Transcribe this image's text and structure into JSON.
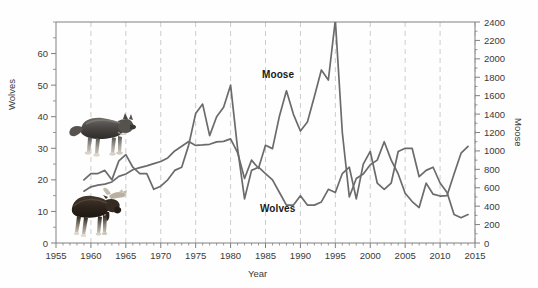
{
  "figure": {
    "background": "#ffffff",
    "line_color_moose": "#6b6b6b",
    "line_color_wolves": "#6b6b6b",
    "grid_color": "#cccccc",
    "axis_color": "#808080",
    "text_color": "#3a3a3a"
  },
  "chart_data": {
    "type": "line",
    "title": "",
    "xlabel": "Year",
    "ylabel": "Wolves",
    "ylabel_right": "Moose",
    "xlim": [
      1955,
      2015
    ],
    "ylim": [
      0,
      70
    ],
    "ylim_right": [
      0,
      2400
    ],
    "grid": true,
    "grid_axis": "x",
    "legend": "inline-annotations",
    "xticks": [
      1955,
      1960,
      1965,
      1970,
      1975,
      1980,
      1985,
      1990,
      1995,
      2000,
      2005,
      2010,
      2015
    ],
    "yticks_left": [
      0,
      10,
      20,
      30,
      40,
      50,
      60
    ],
    "yticks_right": [
      0,
      200,
      400,
      600,
      800,
      1000,
      1200,
      1400,
      1600,
      1800,
      2000,
      2200,
      2400
    ],
    "annotations": [
      {
        "text": "Moose",
        "x": 1989,
        "y": 1800
      },
      {
        "text": "Wolves",
        "x": 1988,
        "y": 340
      }
    ],
    "images": [
      {
        "name": "wolf-photo",
        "x": 1960.5,
        "y": 36
      },
      {
        "name": "moose-photo",
        "x": 1960,
        "y": 11
      }
    ],
    "x": [
      1959,
      1960,
      1961,
      1962,
      1963,
      1964,
      1965,
      1966,
      1967,
      1968,
      1969,
      1970,
      1971,
      1972,
      1973,
      1974,
      1975,
      1976,
      1977,
      1978,
      1979,
      1980,
      1981,
      1982,
      1983,
      1984,
      1985,
      1986,
      1987,
      1988,
      1989,
      1990,
      1991,
      1992,
      1993,
      1994,
      1995,
      1996,
      1997,
      1998,
      1999,
      2000,
      2001,
      2002,
      2003,
      2004,
      2005,
      2006,
      2007,
      2008,
      2009,
      2010,
      2011,
      2012,
      2013,
      2014
    ],
    "series": [
      {
        "name": "Wolves",
        "axis": "left",
        "units": "count",
        "values": [
          20,
          22,
          22,
          23,
          20,
          26,
          28,
          24,
          22,
          22,
          17,
          18,
          20,
          23,
          24,
          31,
          41,
          44,
          34,
          40,
          43,
          50,
          30,
          14,
          23,
          24,
          22,
          20,
          16,
          12,
          12,
          15,
          12,
          12,
          13,
          17,
          16,
          22,
          24,
          14,
          25,
          29,
          19,
          17,
          19,
          29,
          30,
          30,
          21,
          23,
          24,
          19,
          16,
          9,
          8,
          9
        ]
      },
      {
        "name": "Moose",
        "axis": "right",
        "units": "count",
        "values": [
          563,
          610,
          628,
          639,
          663,
          723,
          750,
          795,
          818,
          837,
          862,
          885,
          924,
          1000,
          1050,
          1102,
          1060,
          1065,
          1072,
          1098,
          1104,
          1131,
          982,
          700,
          900,
          811,
          1062,
          1025,
          1380,
          1653,
          1397,
          1216,
          1313,
          1590,
          1879,
          1770,
          2422,
          1200,
          500,
          700,
          750,
          850,
          900,
          1100,
          900,
          750,
          540,
          450,
          385,
          650,
          530,
          510,
          515,
          750,
          975,
          1050
        ]
      }
    ]
  },
  "axes": {
    "left_title": "Wolves",
    "right_title": "Moose",
    "x_title": "Year"
  },
  "labels": {
    "moose": "Moose",
    "wolves": "Wolves"
  }
}
